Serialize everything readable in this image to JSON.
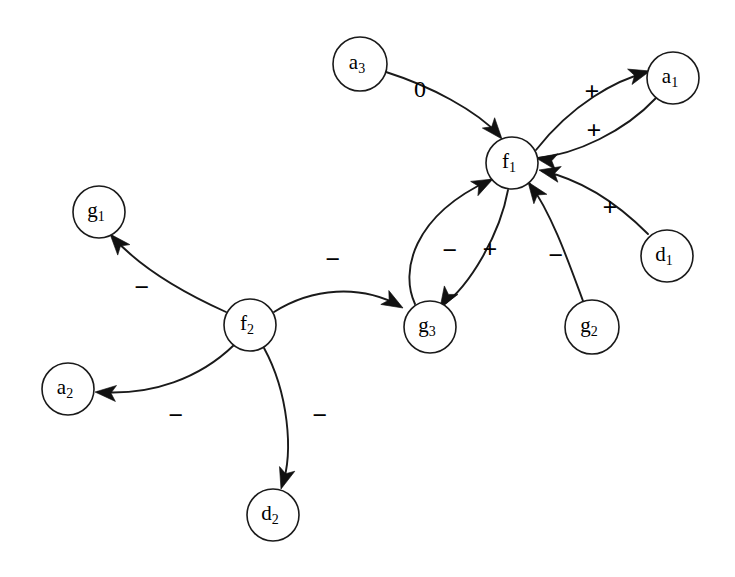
{
  "diagram": {
    "type": "directed-graph",
    "background_color": "#ffffff",
    "stroke_color": "#1a1a1a",
    "label_color": "#000000",
    "nodes": [
      {
        "id": "a3",
        "base": "a",
        "sub": "3",
        "label": "a3",
        "cx": 360,
        "cy": 64,
        "r": 27
      },
      {
        "id": "a1",
        "base": "a",
        "sub": "1",
        "label": "a1",
        "cx": 673,
        "cy": 78,
        "r": 26
      },
      {
        "id": "f1",
        "base": "f",
        "sub": "1",
        "label": "f1",
        "cx": 512,
        "cy": 163,
        "r": 26
      },
      {
        "id": "g1",
        "base": "g",
        "sub": "1",
        "label": "g1",
        "cx": 99,
        "cy": 212,
        "r": 26
      },
      {
        "id": "d1",
        "base": "d",
        "sub": "1",
        "label": "d1",
        "cx": 667,
        "cy": 256,
        "r": 26
      },
      {
        "id": "f2",
        "base": "f",
        "sub": "2",
        "label": "f2",
        "cx": 250,
        "cy": 325,
        "r": 26
      },
      {
        "id": "g3",
        "base": "g",
        "sub": "3",
        "label": "g3",
        "cx": 430,
        "cy": 327,
        "r": 26
      },
      {
        "id": "g2",
        "base": "g",
        "sub": "2",
        "label": "g2",
        "cx": 592,
        "cy": 327,
        "r": 27
      },
      {
        "id": "a2",
        "base": "a",
        "sub": "2",
        "label": "a2",
        "cx": 68,
        "cy": 389,
        "r": 26
      },
      {
        "id": "d2",
        "base": "d",
        "sub": "2",
        "label": "d2",
        "cx": 273,
        "cy": 515,
        "r": 26
      }
    ],
    "edges": [
      {
        "id": "a3-f1",
        "from": "a3",
        "to": "f1",
        "sign": "0",
        "label_x": 420,
        "label_y": 91,
        "path": "M 386 72 C 430 86 476 110 500 136",
        "arrow": {
          "x": 502,
          "y": 139,
          "angle": 50
        }
      },
      {
        "id": "f1-a1",
        "from": "f1",
        "to": "a1",
        "sign": "+",
        "label_x": 592,
        "label_y": 94,
        "path": "M 536 150 C 572 104 616 80 648 72",
        "arrow": {
          "x": 650,
          "y": 71,
          "angle": -16
        }
      },
      {
        "id": "a1-f1",
        "from": "a1",
        "to": "f1",
        "sign": "+",
        "label_x": 594,
        "label_y": 133,
        "path": "M 656 98 C 624 132 576 154 538 158",
        "arrow": {
          "x": 536,
          "y": 158,
          "angle": 190
        }
      },
      {
        "id": "g3-f1",
        "from": "g3",
        "to": "f1",
        "sign": "-",
        "label_x": 450,
        "label_y": 253,
        "path": "M 415 304 C 400 272 412 216 490 180",
        "arrow": {
          "x": 493,
          "y": 179,
          "angle": -27
        }
      },
      {
        "id": "f1-g3",
        "from": "f1",
        "to": "g3",
        "sign": "+",
        "label_x": 490,
        "label_y": 252,
        "path": "M 508 190 C 500 234 470 286 442 306",
        "arrow": {
          "x": 440,
          "y": 308,
          "angle": 122
        }
      },
      {
        "id": "g2-f1",
        "from": "g2",
        "to": "f1",
        "sign": "-",
        "label_x": 556,
        "label_y": 258,
        "path": "M 583 301 C 570 266 552 214 530 184",
        "arrow": {
          "x": 528,
          "y": 182,
          "angle": -126
        }
      },
      {
        "id": "d1-f1",
        "from": "d1",
        "to": "f1",
        "sign": "+",
        "label_x": 610,
        "label_y": 210,
        "path": "M 648 234 C 620 206 584 180 542 171",
        "arrow": {
          "x": 539,
          "y": 170,
          "angle": 192
        }
      },
      {
        "id": "f2-g1",
        "from": "f2",
        "to": "g1",
        "sign": "-",
        "label_x": 142,
        "label_y": 290,
        "path": "M 226 312 C 186 294 140 268 112 236",
        "arrow": {
          "x": 110,
          "y": 234,
          "angle": -131
        }
      },
      {
        "id": "f2-a2",
        "from": "f2",
        "to": "a2",
        "sign": "-",
        "label_x": 176,
        "label_y": 418,
        "path": "M 234 345 C 200 378 152 396 98 392",
        "arrow": {
          "x": 95,
          "y": 392,
          "angle": 184
        }
      },
      {
        "id": "f2-d2",
        "from": "f2",
        "to": "d2",
        "sign": "-",
        "label_x": 320,
        "label_y": 418,
        "path": "M 264 348 C 288 392 294 452 282 486",
        "arrow": {
          "x": 281,
          "y": 489,
          "angle": 107
        }
      },
      {
        "id": "f2-g3",
        "from": "f2",
        "to": "g3",
        "sign": "-",
        "label_x": 333,
        "label_y": 262,
        "path": "M 274 312 C 312 288 360 284 400 306",
        "arrow": {
          "x": 403,
          "y": 308,
          "angle": 30
        }
      }
    ],
    "legend": {
      "sign_positive": "+",
      "sign_negative": "-",
      "sign_zero": "0"
    }
  }
}
